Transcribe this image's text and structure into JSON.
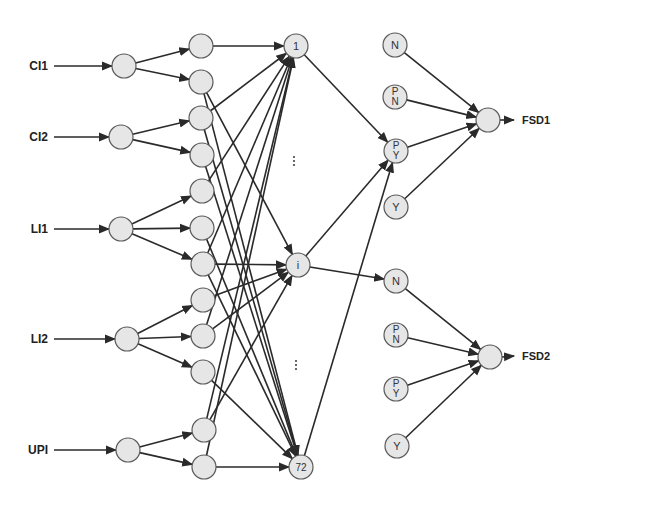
{
  "diagram": {
    "type": "neural-network",
    "colors": {
      "node_fill": "#e6e6e6",
      "node_stroke": "#5a5a5a",
      "edge": "#2a2a2a",
      "background": "#ffffff"
    },
    "inputs": [
      {
        "label": "CI1",
        "x": 52,
        "y": 66
      },
      {
        "label": "CI2",
        "x": 52,
        "y": 137
      },
      {
        "label": "LI1",
        "x": 52,
        "y": 229
      },
      {
        "label": "LI2",
        "x": 52,
        "y": 339
      },
      {
        "label": "UPI",
        "x": 52,
        "y": 450
      }
    ],
    "layer1": [
      {
        "x": 124,
        "y": 66
      },
      {
        "x": 121,
        "y": 137
      },
      {
        "x": 121,
        "y": 229
      },
      {
        "x": 127,
        "y": 339
      },
      {
        "x": 128,
        "y": 450
      }
    ],
    "layer2": [
      {
        "x": 201,
        "y": 46
      },
      {
        "x": 201,
        "y": 82
      },
      {
        "x": 201,
        "y": 118
      },
      {
        "x": 202,
        "y": 155
      },
      {
        "x": 202,
        "y": 191
      },
      {
        "x": 202,
        "y": 228
      },
      {
        "x": 203,
        "y": 264
      },
      {
        "x": 203,
        "y": 300
      },
      {
        "x": 203,
        "y": 336
      },
      {
        "x": 203,
        "y": 372
      },
      {
        "x": 204,
        "y": 430
      },
      {
        "x": 204,
        "y": 467
      }
    ],
    "layer3": [
      {
        "label": "1",
        "x": 296,
        "y": 46
      },
      {
        "label": "i",
        "x": 298,
        "y": 265
      },
      {
        "label": "72",
        "x": 301,
        "y": 467
      }
    ],
    "ellipses": [
      {
        "label": "⋮",
        "x": 294,
        "y": 161
      },
      {
        "label": "⋮",
        "x": 296,
        "y": 365
      }
    ],
    "layer4": [
      {
        "label": "N",
        "x": 395,
        "y": 45
      },
      {
        "label": "P\nN",
        "x": 395,
        "y": 97
      },
      {
        "label": "P\nY",
        "x": 396,
        "y": 151
      },
      {
        "label": "Y",
        "x": 396,
        "y": 207
      },
      {
        "label": "N",
        "x": 396,
        "y": 281
      },
      {
        "label": "P\nN",
        "x": 396,
        "y": 335
      },
      {
        "label": "P\nY",
        "x": 396,
        "y": 389
      },
      {
        "label": "Y",
        "x": 397,
        "y": 446
      }
    ],
    "outputs": [
      {
        "x": 488,
        "y": 120,
        "label": "FSD1",
        "label_x": 522,
        "label_y": 120
      },
      {
        "x": 490,
        "y": 357,
        "label": "FSD2",
        "label_x": 522,
        "label_y": 356
      }
    ],
    "edges_input_to_l1": [
      [
        0,
        0
      ],
      [
        1,
        1
      ],
      [
        2,
        2
      ],
      [
        3,
        3
      ],
      [
        4,
        4
      ]
    ],
    "edges_l1_to_l2": [
      [
        0,
        0
      ],
      [
        0,
        1
      ],
      [
        1,
        2
      ],
      [
        1,
        3
      ],
      [
        2,
        4
      ],
      [
        2,
        5
      ],
      [
        2,
        6
      ],
      [
        3,
        7
      ],
      [
        3,
        8
      ],
      [
        3,
        9
      ],
      [
        4,
        10
      ],
      [
        4,
        11
      ]
    ],
    "edges_l2_to_l3": [
      [
        0,
        0
      ],
      [
        2,
        0
      ],
      [
        4,
        0
      ],
      [
        6,
        0
      ],
      [
        8,
        0
      ],
      [
        10,
        0
      ],
      [
        11,
        0
      ],
      [
        1,
        1
      ],
      [
        6,
        1
      ],
      [
        7,
        1
      ],
      [
        8,
        1
      ],
      [
        10,
        1
      ],
      [
        1,
        2
      ],
      [
        2,
        2
      ],
      [
        3,
        2
      ],
      [
        6,
        2
      ],
      [
        9,
        2
      ],
      [
        11,
        2
      ],
      [
        5,
        2
      ]
    ],
    "edges_l3_to_l4": [
      [
        0,
        2
      ],
      [
        1,
        2
      ],
      [
        1,
        4
      ],
      [
        2,
        2
      ]
    ],
    "edges_l4_to_out": [
      [
        0,
        0
      ],
      [
        1,
        0
      ],
      [
        2,
        0
      ],
      [
        3,
        0
      ],
      [
        4,
        1
      ],
      [
        5,
        1
      ],
      [
        6,
        1
      ],
      [
        7,
        1
      ]
    ]
  }
}
